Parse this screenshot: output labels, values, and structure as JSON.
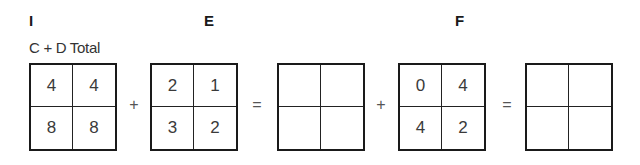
{
  "labels": {
    "I": "I",
    "E": "E",
    "F": "F"
  },
  "subtitle": "C + D Total",
  "grids": [
    {
      "cells": [
        "4",
        "4",
        "8",
        "8"
      ]
    },
    {
      "cells": [
        "2",
        "1",
        "3",
        "2"
      ]
    },
    {
      "cells": [
        "",
        "",
        "",
        ""
      ]
    },
    {
      "cells": [
        "0",
        "4",
        "4",
        "2"
      ]
    },
    {
      "cells": [
        "",
        "",
        "",
        ""
      ]
    }
  ],
  "operators": [
    "+",
    "=",
    "+",
    "="
  ]
}
